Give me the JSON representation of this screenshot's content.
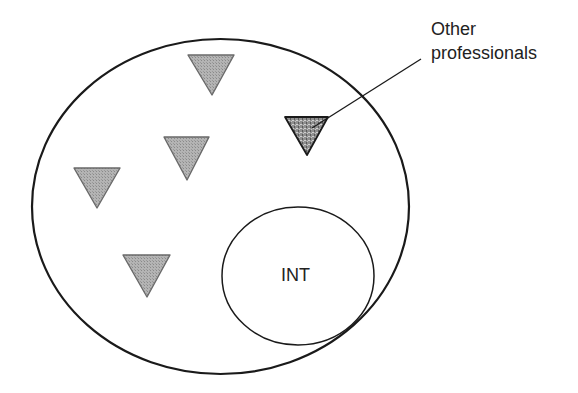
{
  "diagram": {
    "type": "set-membership diagram",
    "outer_set": {
      "shape": "ellipse",
      "cx": 220.5,
      "cy": 206.5,
      "rx": 188.5,
      "ry": 167.5,
      "stroke": "#1a1a1a",
      "stroke_width": 2.2
    },
    "inner_set": {
      "label": "INT",
      "shape": "ellipse",
      "cx": 298,
      "cy": 276,
      "rx": 76,
      "ry": 69,
      "stroke": "#1a1a1a",
      "stroke_width": 1.5
    },
    "markers": [
      {
        "id": "m1",
        "kind": "light",
        "points": "188,55 234,55 212,95"
      },
      {
        "id": "m2",
        "kind": "light",
        "points": "164,137 209,137 187,180"
      },
      {
        "id": "m3",
        "kind": "light",
        "points": "74,168 120,168 97,208"
      },
      {
        "id": "m4",
        "kind": "light",
        "points": "123,255 170,255 147,297"
      },
      {
        "id": "m5",
        "kind": "highlighted",
        "points": "285,117 328,117 307,155"
      }
    ],
    "marker_colors": {
      "light_fill": "#a9a9a9",
      "light_stroke": "#6a6a6a",
      "highlighted_fill": "#8c8c8c",
      "highlighted_stroke": "#1a1a1a"
    },
    "callout": {
      "line_one": "Other",
      "line_two": "professionals",
      "leader": {
        "x1": 421,
        "y1": 59,
        "x2": 312,
        "y2": 128
      },
      "target_marker": "m5"
    }
  }
}
